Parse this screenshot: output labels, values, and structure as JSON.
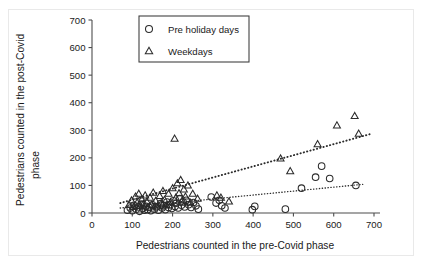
{
  "chart_data": {
    "type": "scatter",
    "title": "",
    "xlabel": "Pedestrians counted in the pre-Covid phase",
    "ylabel_line1": "Pedestrians counted in the post-Covid",
    "ylabel_line2": "phase",
    "xlim": [
      0,
      700
    ],
    "ylim": [
      0,
      700
    ],
    "xticks": [
      0,
      100,
      200,
      300,
      400,
      500,
      600,
      700
    ],
    "yticks": [
      0,
      100,
      200,
      300,
      400,
      500,
      600,
      700
    ],
    "grid": false,
    "legend_position": "top-center",
    "marker_color": "#2b2b2b",
    "axis_color": "#4d4d4d",
    "legend": [
      {
        "label": "Pre holiday days",
        "marker": "circle"
      },
      {
        "label": "Weekdays",
        "marker": "triangle"
      }
    ],
    "series": [
      {
        "name": "Pre holiday days",
        "marker": "circle",
        "points": [
          [
            88,
            10
          ],
          [
            95,
            18
          ],
          [
            100,
            8
          ],
          [
            104,
            28
          ],
          [
            110,
            14
          ],
          [
            115,
            22
          ],
          [
            118,
            6
          ],
          [
            122,
            32
          ],
          [
            126,
            16
          ],
          [
            130,
            10
          ],
          [
            134,
            24
          ],
          [
            138,
            12
          ],
          [
            142,
            20
          ],
          [
            146,
            8
          ],
          [
            150,
            30
          ],
          [
            155,
            14
          ],
          [
            160,
            22
          ],
          [
            165,
            10
          ],
          [
            170,
            34
          ],
          [
            174,
            18
          ],
          [
            178,
            26
          ],
          [
            182,
            12
          ],
          [
            186,
            40
          ],
          [
            190,
            20
          ],
          [
            194,
            30
          ],
          [
            198,
            16
          ],
          [
            202,
            44
          ],
          [
            206,
            24
          ],
          [
            210,
            36
          ],
          [
            214,
            18
          ],
          [
            218,
            52
          ],
          [
            222,
            28
          ],
          [
            226,
            40
          ],
          [
            230,
            22
          ],
          [
            234,
            46
          ],
          [
            240,
            30
          ],
          [
            246,
            20
          ],
          [
            252,
            38
          ],
          [
            258,
            26
          ],
          [
            264,
            14
          ],
          [
            296,
            58
          ],
          [
            308,
            36
          ],
          [
            316,
            46
          ],
          [
            322,
            26
          ],
          [
            330,
            18
          ],
          [
            398,
            12
          ],
          [
            404,
            24
          ],
          [
            480,
            14
          ],
          [
            520,
            90
          ],
          [
            555,
            130
          ],
          [
            570,
            170
          ],
          [
            590,
            125
          ],
          [
            655,
            100
          ]
        ]
      },
      {
        "name": "Weekdays",
        "marker": "triangle",
        "points": [
          [
            92,
            30
          ],
          [
            98,
            46
          ],
          [
            103,
            22
          ],
          [
            108,
            60
          ],
          [
            112,
            38
          ],
          [
            116,
            70
          ],
          [
            120,
            26
          ],
          [
            124,
            50
          ],
          [
            128,
            34
          ],
          [
            132,
            64
          ],
          [
            136,
            42
          ],
          [
            140,
            20
          ],
          [
            144,
            56
          ],
          [
            148,
            30
          ],
          [
            152,
            74
          ],
          [
            158,
            44
          ],
          [
            163,
            24
          ],
          [
            168,
            62
          ],
          [
            172,
            36
          ],
          [
            176,
            80
          ],
          [
            180,
            48
          ],
          [
            185,
            28
          ],
          [
            190,
            70
          ],
          [
            195,
            40
          ],
          [
            200,
            90
          ],
          [
            205,
            270
          ],
          [
            208,
            56
          ],
          [
            212,
            108
          ],
          [
            216,
            72
          ],
          [
            220,
            120
          ],
          [
            224,
            46
          ],
          [
            228,
            86
          ],
          [
            232,
            60
          ],
          [
            238,
            100
          ],
          [
            244,
            38
          ],
          [
            250,
            70
          ],
          [
            262,
            52
          ],
          [
            310,
            64
          ],
          [
            320,
            56
          ],
          [
            340,
            42
          ],
          [
            468,
            198
          ],
          [
            492,
            152
          ],
          [
            560,
            250
          ],
          [
            608,
            318
          ],
          [
            652,
            352
          ],
          [
            662,
            288
          ]
        ]
      }
    ],
    "trendlines": [
      {
        "name": "Weekdays",
        "x0": 70,
        "y0": 36,
        "x1": 690,
        "y1": 286,
        "style": "dotted-thick"
      },
      {
        "name": "Pre holiday days",
        "x0": 70,
        "y0": 18,
        "x1": 672,
        "y1": 104,
        "style": "dotted-thin"
      }
    ]
  }
}
